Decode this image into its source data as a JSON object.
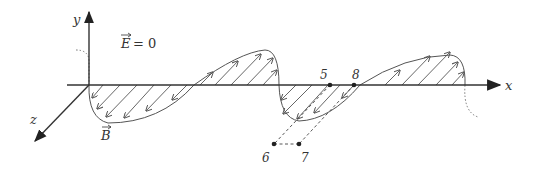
{
  "diagram": {
    "type": "electromagnetic-wave-magnetic-field-only",
    "axes": {
      "x_label": "x",
      "y_label": "y",
      "z_label": "z"
    },
    "annotations": {
      "e_field": "E = 0",
      "e_symbol": "E",
      "e_value": "= 0",
      "b_field": "B"
    },
    "points": [
      {
        "id": "5",
        "label": "5"
      },
      {
        "id": "8",
        "label": "8"
      },
      {
        "id": "6",
        "label": "6"
      },
      {
        "id": "7",
        "label": "7"
      }
    ],
    "colors": {
      "axis": "#333333",
      "wave": "#555555",
      "hatch": "#555555",
      "dashed": "#444444"
    }
  }
}
